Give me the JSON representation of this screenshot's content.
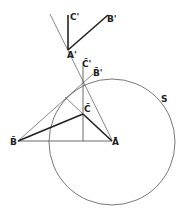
{
  "diagram": {
    "colors": {
      "background": "#ffffff",
      "stroke": "#333333",
      "thin": "#555555"
    },
    "circle": {
      "label": "S",
      "cx": 112,
      "cy": 142,
      "r": 63
    },
    "points": {
      "A_bar": {
        "label": "Ā",
        "x": 112,
        "y": 140
      },
      "B_bar": {
        "label": "B̄",
        "x": 18,
        "y": 141
      },
      "C_bar": {
        "label": "C̄",
        "x": 83,
        "y": 114
      },
      "C_bar_prime": {
        "label": "C̄'",
        "x": 83,
        "y": 65
      },
      "B_bar_prime": {
        "label": "B̄'",
        "x": 93,
        "y": 74
      },
      "A_prime": {
        "label": "A'",
        "x": 68,
        "y": 50
      },
      "C_prime": {
        "label": "C'",
        "x": 68,
        "y": 15
      },
      "B_prime": {
        "label": "B'",
        "x": 108,
        "y": 15
      }
    },
    "labels": {
      "A_bar": "Ā",
      "B_bar": "B̄",
      "C_bar": "C̄",
      "C_bar_prime": "C̄'",
      "B_bar_prime": "B̄'",
      "A_prime": "A'",
      "C_prime": "C'",
      "B_prime": "B'",
      "S": "S"
    }
  }
}
